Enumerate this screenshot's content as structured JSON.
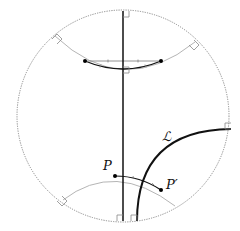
{
  "diagram": {
    "labels": {
      "line": "ℒ",
      "point": "P",
      "point_image": "P′"
    },
    "colors": {
      "boundary": "#8a8a8a",
      "geodesic_light": "#b5b5b5",
      "geodesic_dark": "#111111",
      "point": "#000000"
    },
    "elements": {
      "boundary_circle": {
        "cx": 123,
        "cy": 116,
        "r": 106,
        "style": "dotted"
      },
      "vertical_diameter": {
        "x": 123,
        "y1": 11,
        "y2": 221
      },
      "line_L": {
        "from": [
          137,
          221
        ],
        "to": [
          231,
          129
        ]
      },
      "points": [
        {
          "name": "top-left-point",
          "x": 85,
          "y": 61
        },
        {
          "name": "top-right-point",
          "x": 161,
          "y": 61
        },
        {
          "name": "P",
          "x": 115,
          "y": 176
        },
        {
          "name": "P-prime",
          "x": 161,
          "y": 190
        }
      ]
    }
  }
}
